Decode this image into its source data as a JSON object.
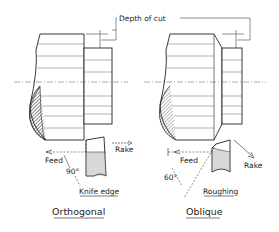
{
  "labels": {
    "depth_of_cut": "Depth of cut",
    "left": {
      "rake": "Rake",
      "feed": "Feed",
      "angle": "90°",
      "edge": "Knife edge",
      "caption": "Orthogonal"
    },
    "right": {
      "rake": "Rake",
      "feed": "Feed",
      "angle": "60°",
      "edge": "Roughing",
      "caption": "Oblique"
    }
  },
  "colors": {
    "ink": "#222222",
    "hatch": "#444444",
    "background": "#ffffff"
  }
}
